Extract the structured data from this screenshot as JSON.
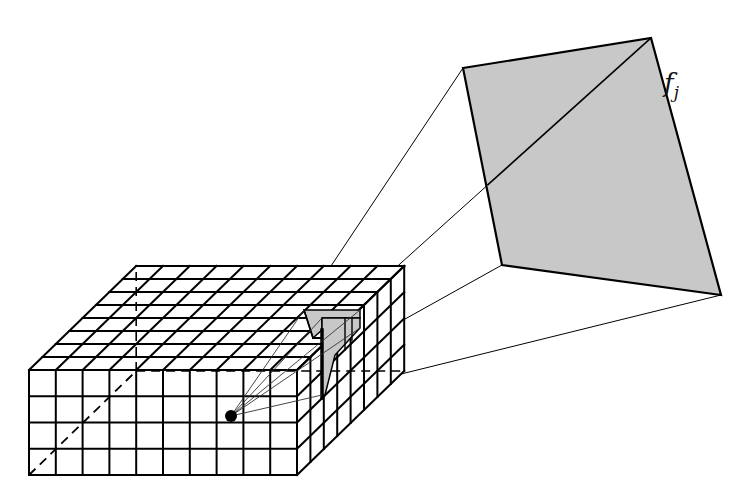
{
  "diagram": {
    "type": "receptive-field-projection",
    "volume": {
      "columns": 10,
      "rows": 4,
      "depth": 8,
      "front_bottom_left": [
        29,
        475
      ],
      "cell_width": 26.8,
      "cell_height": 26.25,
      "depth_step": [
        13.4,
        -13.0
      ],
      "line_color": "#000000",
      "highlight_fill": "#c8c8c8"
    },
    "point": {
      "x": 231,
      "y": 416,
      "color": "#000000"
    },
    "feature_plane": {
      "label_main": "f",
      "label_sub": "j",
      "corners": [
        [
          463,
          68
        ],
        [
          651,
          38
        ],
        [
          721,
          295
        ],
        [
          502,
          265
        ]
      ],
      "fill": "#c8c8c8",
      "stroke": "#000000"
    }
  }
}
